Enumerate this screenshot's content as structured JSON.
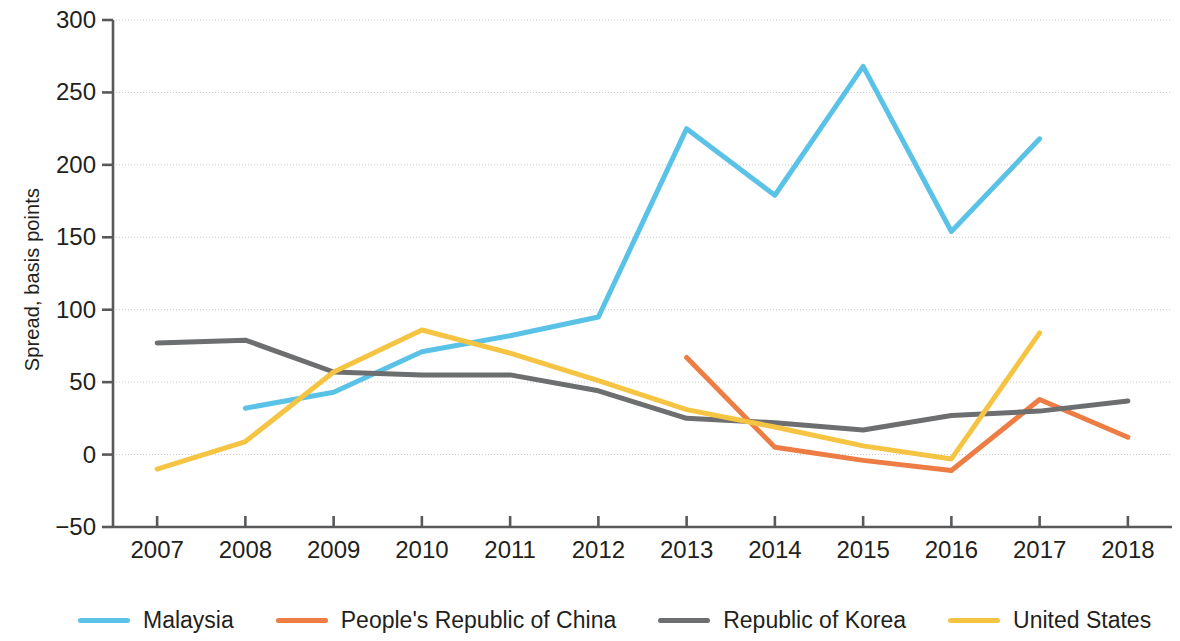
{
  "chart_data": {
    "type": "line",
    "title": "",
    "xlabel": "",
    "ylabel": "Spread, basis points",
    "x": [
      2007,
      2008,
      2009,
      2010,
      2011,
      2012,
      2013,
      2014,
      2015,
      2016,
      2017,
      2018
    ],
    "xtick_labels": [
      "2007",
      "2008",
      "2009",
      "2010",
      "2011",
      "2012",
      "2013",
      "2014",
      "2015",
      "2016",
      "2017",
      "2018"
    ],
    "ytick_labels": [
      "300",
      "250",
      "200",
      "150",
      "100",
      "50",
      "0",
      "−50"
    ],
    "ytick_values": [
      300,
      250,
      200,
      150,
      100,
      50,
      0,
      -50
    ],
    "ylim": [
      -50,
      300
    ],
    "xlim": [
      2006.5,
      2018.5
    ],
    "grid": true,
    "legend_position": "bottom",
    "series": [
      {
        "name": "Malaysia",
        "color": "#5BC2E7",
        "x": [
          2008,
          2009,
          2010,
          2011,
          2012,
          2013,
          2014,
          2015,
          2016,
          2017
        ],
        "values": [
          32,
          43,
          71,
          82,
          95,
          225,
          179,
          268,
          154,
          218
        ]
      },
      {
        "name": "People's Republic of China",
        "color": "#ED7D45",
        "x": [
          2013,
          2014,
          2015,
          2016,
          2017,
          2018
        ],
        "values": [
          67,
          5,
          -4,
          -11,
          38,
          12
        ]
      },
      {
        "name": "Republic of Korea",
        "color": "#6D6E6F",
        "x": [
          2007,
          2008,
          2009,
          2010,
          2011,
          2012,
          2013,
          2014,
          2015,
          2016,
          2017,
          2018
        ],
        "values": [
          77,
          79,
          57,
          55,
          55,
          44,
          25,
          22,
          17,
          27,
          30,
          37
        ]
      },
      {
        "name": "United States",
        "color": "#F5C442",
        "x": [
          2007,
          2008,
          2009,
          2010,
          2011,
          2012,
          2013,
          2014,
          2015,
          2016,
          2017
        ],
        "values": [
          -10,
          9,
          57,
          86,
          70,
          51,
          31,
          19,
          6,
          -3,
          84
        ]
      }
    ]
  },
  "legend": {
    "items": [
      {
        "label": "Malaysia",
        "color": "#5BC2E7"
      },
      {
        "label": "People's Republic of China",
        "color": "#ED7D45"
      },
      {
        "label": "Republic of Korea",
        "color": "#6D6E6F"
      },
      {
        "label": "United States",
        "color": "#F5C442"
      }
    ]
  },
  "axes": {
    "y_title": "Spread, basis points"
  }
}
